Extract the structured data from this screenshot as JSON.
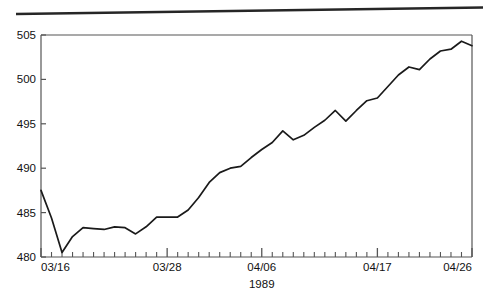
{
  "figure": {
    "background_color": "#ffffff",
    "line_color": "#1a1a1a",
    "axis_color": "#555555",
    "top_rule_label": "top-scan-rule"
  },
  "chart_data": {
    "type": "line",
    "title": "",
    "subtitle": "",
    "xlabel": "1989",
    "ylabel": "",
    "grid": false,
    "legend": null,
    "ylim": [
      480,
      505
    ],
    "yticks": [
      480,
      485,
      490,
      495,
      500,
      505
    ],
    "ytick_labels": [
      "480",
      "485",
      "490",
      "495",
      "500",
      "505"
    ],
    "xlim": [
      "03/16",
      "04/26"
    ],
    "xticks": [
      "03/16",
      "03/28",
      "04/06",
      "04/17",
      "04/26"
    ],
    "xtick_labels": [
      "03/16",
      "03/28",
      "04/06",
      "04/17",
      "04/26"
    ],
    "xtick_positions": [
      0,
      12,
      21,
      32,
      41
    ],
    "minor_tick_count": 41,
    "x": [
      "03/16",
      "03/17",
      "03/18",
      "03/19",
      "03/20",
      "03/21",
      "03/22",
      "03/23",
      "03/24",
      "03/25",
      "03/26",
      "03/27",
      "03/28",
      "03/29",
      "03/30",
      "03/31",
      "04/01",
      "04/02",
      "04/03",
      "04/04",
      "04/05",
      "04/06",
      "04/07",
      "04/08",
      "04/09",
      "04/10",
      "04/11",
      "04/12",
      "04/13",
      "04/14",
      "04/15",
      "04/16",
      "04/17",
      "04/18",
      "04/19",
      "04/20",
      "04/21",
      "04/22",
      "04/23",
      "04/24",
      "04/25",
      "04/26"
    ],
    "values": [
      487.5,
      484.4,
      480.5,
      482.3,
      483.3,
      483.2,
      483.1,
      483.4,
      483.3,
      482.6,
      483.4,
      484.5,
      484.5,
      484.5,
      485.3,
      486.7,
      488.4,
      489.5,
      490.0,
      490.2,
      491.2,
      492.1,
      492.9,
      494.2,
      493.2,
      493.7,
      494.6,
      495.4,
      496.5,
      495.3,
      496.5,
      497.6,
      497.9,
      499.2,
      500.5,
      501.4,
      501.1,
      502.3,
      503.2,
      503.4,
      504.3,
      503.8
    ],
    "series": [
      {
        "name": "series-1",
        "values": [
          487.5,
          484.4,
          480.5,
          482.3,
          483.3,
          483.2,
          483.1,
          483.4,
          483.3,
          482.6,
          483.4,
          484.5,
          484.5,
          484.5,
          485.3,
          486.7,
          488.4,
          489.5,
          490.0,
          490.2,
          491.2,
          492.1,
          492.9,
          494.2,
          493.2,
          493.7,
          494.6,
          495.4,
          496.5,
          495.3,
          496.5,
          497.6,
          497.9,
          499.2,
          500.5,
          501.4,
          501.1,
          502.3,
          503.2,
          503.4,
          504.3,
          503.8
        ]
      }
    ]
  }
}
